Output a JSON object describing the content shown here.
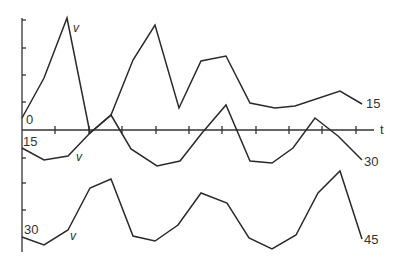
{
  "diagram": {
    "type": "line",
    "axis": {
      "t_label": "t",
      "x_ticks_px": [
        55,
        89,
        122,
        156,
        189,
        222,
        256,
        289,
        322,
        356
      ],
      "y_ticks_px": [
        20,
        48,
        75,
        102,
        158,
        183,
        210,
        236
      ]
    },
    "series": [
      {
        "name": "trace-0-15",
        "start_label": "0",
        "end_label": "15",
        "marker_label": "v",
        "points": [
          [
            22,
            118
          ],
          [
            44,
            78
          ],
          [
            67,
            18
          ],
          [
            90,
            133
          ],
          [
            111,
            115
          ],
          [
            133,
            60
          ],
          [
            155,
            25
          ],
          [
            179,
            108
          ],
          [
            201,
            61
          ],
          [
            226,
            56
          ],
          [
            250,
            103
          ],
          [
            275,
            108
          ],
          [
            295,
            106
          ],
          [
            340,
            91
          ],
          [
            362,
            104
          ]
        ]
      },
      {
        "name": "trace-15-30",
        "start_label": "15",
        "end_label": "30",
        "marker_label": "v",
        "points": [
          [
            22,
            148
          ],
          [
            44,
            160
          ],
          [
            68,
            156
          ],
          [
            90,
            133
          ],
          [
            111,
            115
          ],
          [
            131,
            149
          ],
          [
            157,
            166
          ],
          [
            180,
            161
          ],
          [
            202,
            133
          ],
          [
            226,
            105
          ],
          [
            250,
            161
          ],
          [
            272,
            163
          ],
          [
            293,
            148
          ],
          [
            315,
            118
          ],
          [
            338,
            136
          ],
          [
            362,
            160
          ]
        ]
      },
      {
        "name": "trace-30-45",
        "start_label": "30",
        "end_label": "45",
        "marker_label": "v",
        "points": [
          [
            22,
            237
          ],
          [
            44,
            245
          ],
          [
            68,
            230
          ],
          [
            90,
            188
          ],
          [
            111,
            179
          ],
          [
            133,
            236
          ],
          [
            155,
            241
          ],
          [
            178,
            225
          ],
          [
            201,
            193
          ],
          [
            227,
            203
          ],
          [
            249,
            238
          ],
          [
            272,
            249
          ],
          [
            296,
            235
          ],
          [
            318,
            193
          ],
          [
            340,
            171
          ],
          [
            362,
            239
          ]
        ]
      }
    ],
    "labels": {
      "t": "t",
      "s0_start": "0",
      "s0_end": "15",
      "s1_start": "15",
      "s1_end": "30",
      "s2_start": "30",
      "s2_end": "45",
      "v": "v"
    }
  }
}
